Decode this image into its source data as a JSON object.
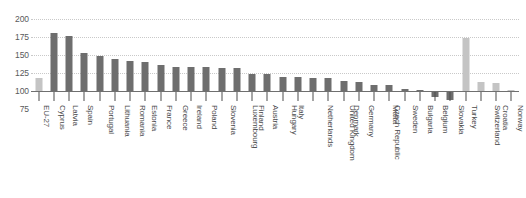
{
  "chart_data": {
    "type": "bar",
    "title": "",
    "subtitle": "",
    "xlabel": "",
    "ylabel": "",
    "ylim": [
      75,
      200
    ],
    "yticks": [
      200,
      175,
      150,
      125,
      100,
      75
    ],
    "baseline": 100,
    "grid": true,
    "legend": "none",
    "colors": {
      "highlight": "#c4c4c4",
      "standard": "#6e6e6e",
      "gridline": "#c9c9c9",
      "axis": "#6f6f6f",
      "label": "#4a4a4c"
    },
    "categories": [
      "EU-27",
      "Cyprus",
      "Latvia",
      "Spain",
      "Portugal",
      "Lithuania",
      "Romania",
      "Estonia",
      "France",
      "Greece",
      "Ireland",
      "Poland",
      "Slovenia",
      "Luxembourg",
      "Finland",
      "Austria",
      "Hungary",
      "Italy",
      "Netherlands",
      "United Kingdom",
      "Denmark",
      "Germany",
      "Czech Republic",
      "Malta",
      "Sweden",
      "Bulgaria",
      "Belgium",
      "Slovakia",
      "Turkey",
      "Switzerland",
      "Croatia",
      "Norway"
    ],
    "values": [
      118,
      181,
      176,
      153,
      149,
      145,
      141,
      140,
      136,
      134,
      133,
      133,
      132,
      132,
      123,
      123,
      120,
      120,
      118,
      118,
      114,
      112,
      109,
      108,
      103,
      102,
      92,
      88,
      173,
      112,
      111,
      102
    ],
    "series_styles": [
      "light",
      "dark",
      "dark",
      "dark",
      "dark",
      "dark",
      "dark",
      "dark",
      "dark",
      "dark",
      "dark",
      "dark",
      "dark",
      "dark",
      "dark",
      "dark",
      "dark",
      "dark",
      "dark",
      "dark",
      "dark",
      "dark",
      "dark",
      "dark",
      "dark",
      "dark",
      "dark",
      "dark",
      "light",
      "light",
      "light",
      "light"
    ]
  }
}
